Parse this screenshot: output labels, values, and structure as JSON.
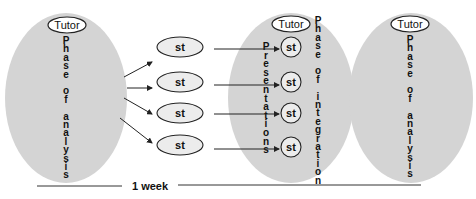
{
  "diagram": {
    "colors": {
      "phase_fill": "#d4d4d4",
      "student_fill": "#ececec",
      "outline": "#222222",
      "text": "#111111"
    },
    "phases": [
      {
        "id": "analysis-1",
        "tutor_label": "Tutor",
        "vertical_label": "Phase of analysis"
      },
      {
        "id": "integration",
        "tutor_label": "Tutor",
        "vertical_label": "Phase of integration",
        "secondary_vertical_label": "Presentations"
      },
      {
        "id": "analysis-2",
        "tutor_label": "Tutor",
        "vertical_label": "Phase of analysis"
      }
    ],
    "students_left": [
      "st",
      "st",
      "st",
      "st"
    ],
    "students_right": [
      "st",
      "st",
      "st",
      "st"
    ],
    "timeline": {
      "label": "1 week"
    }
  }
}
